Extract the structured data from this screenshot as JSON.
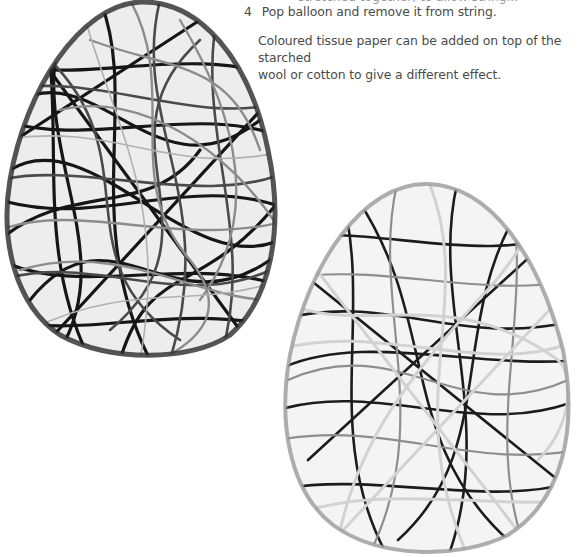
{
  "page": {
    "cut_off_line": "stretched together, to allow string...",
    "steps": [
      {
        "number": "4",
        "text": "Pop balloon and remove it from string."
      }
    ],
    "note": {
      "line1": "Coloured tissue paper can be added on top of the starched",
      "line2": "wool or cotton to give a different effect."
    }
  },
  "images": {
    "egg_left": {
      "description": "dark string egg made from starched wool",
      "colors": [
        "#1a1a1a",
        "#555555",
        "#8a8a8a"
      ]
    },
    "egg_right": {
      "description": "light and dark string egg made from starched cotton",
      "colors": [
        "#1a1a1a",
        "#9a9a9a",
        "#d8d8d8"
      ]
    }
  }
}
